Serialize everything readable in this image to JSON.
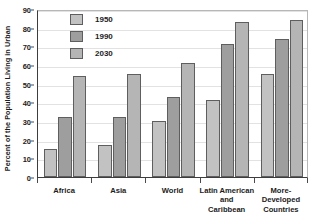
{
  "chart_data": {
    "type": "bar",
    "title": "",
    "xlabel": "",
    "ylabel": "Percent of the Population Living in Urban",
    "ylim": [
      0,
      90
    ],
    "ytick_step": 10,
    "yticks": [
      0,
      10,
      20,
      30,
      40,
      50,
      60,
      70,
      80,
      90
    ],
    "ytick_labels": [
      "0",
      "10",
      "20",
      "30",
      "40",
      "50",
      "60",
      "70",
      "80",
      "90"
    ],
    "grid": true,
    "legend_position": "top-left-inside",
    "categories": [
      "Africa",
      "Asia",
      "World",
      "Latin American and Caribbean",
      "More-Developed Countries"
    ],
    "category_label_lines": [
      [
        "Africa"
      ],
      [
        "Asia"
      ],
      [
        "World"
      ],
      [
        "Latin American",
        "and",
        "Caribbean"
      ],
      [
        "More-",
        "Developed",
        "Countries"
      ]
    ],
    "series": [
      {
        "name": "1950",
        "color": "#c2c2c2",
        "values": [
          15,
          17,
          30,
          41,
          55
        ]
      },
      {
        "name": "1990",
        "color": "#9e9e9e",
        "values": [
          32,
          32,
          43,
          71,
          74
        ]
      },
      {
        "name": "2030",
        "color": "#b5b5b5",
        "values": [
          54,
          55,
          61,
          83,
          84
        ]
      }
    ]
  },
  "legend": {
    "items": [
      {
        "label": "1950"
      },
      {
        "label": "1990"
      },
      {
        "label": "2030"
      }
    ]
  },
  "style": {
    "axis_color": "#3d3d3d",
    "grid_color": "#e2e2e2",
    "text_color": "#1c1c1c",
    "bar_border": "#5e5e5e",
    "background": "#ffffff"
  }
}
